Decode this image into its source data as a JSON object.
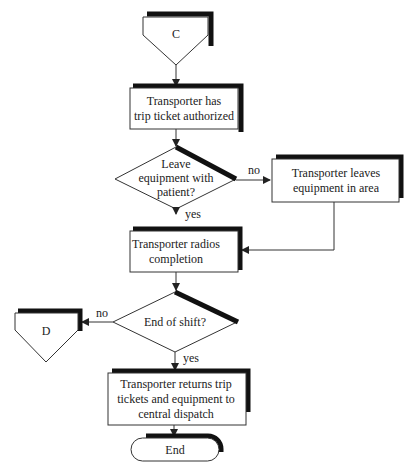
{
  "flowchart": {
    "connector_start": {
      "label": "C"
    },
    "step1": {
      "line1": "Transporter has",
      "line2": "trip ticket authorized"
    },
    "decision1": {
      "line1": "Leave",
      "line2": "equipment with",
      "line3": "patient?",
      "no_label": "no",
      "yes_label": "yes"
    },
    "step_leave": {
      "line1": "Transporter leaves",
      "line2": "equipment in area"
    },
    "step2": {
      "line1": "Transporter radios",
      "line2": "completion"
    },
    "decision2": {
      "label": "End of shift?",
      "no_label": "no",
      "yes_label": "yes"
    },
    "connector_d": {
      "label": "D"
    },
    "step3": {
      "line1": "Transporter returns trip",
      "line2": "tickets and equipment to",
      "line3": "central dispatch"
    },
    "terminator": {
      "label": "End"
    }
  },
  "colors": {
    "stroke": "#333333",
    "shadow": "#111111",
    "background": "#ffffff"
  }
}
